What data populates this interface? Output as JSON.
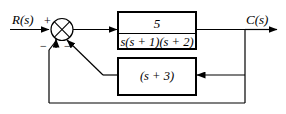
{
  "diagram": {
    "kind": "control-system-block-diagram",
    "input_signal": "R(s)",
    "output_signal": "C(s)",
    "summing_junction": {
      "name": "summing-junction",
      "input_sign": "+",
      "feedback_sign_left": "−",
      "feedback_sign_right": "−"
    },
    "forward_block": {
      "name": "forward-path-transfer-function",
      "numerator": "5",
      "denominator": "s(s + 1)(s + 2)"
    },
    "feedback_block": {
      "name": "feedback-path-transfer-function",
      "expression": "(s + 3)"
    },
    "colors": {
      "line": "#000000",
      "background": "#ffffff"
    }
  }
}
